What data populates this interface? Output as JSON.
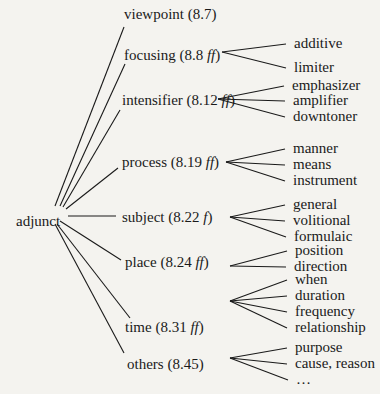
{
  "root": {
    "label": "adjunct"
  },
  "categories": [
    {
      "name": "viewpoint",
      "ref": "8.7",
      "suffix": "",
      "children": []
    },
    {
      "name": "focusing",
      "ref": "8.8",
      "suffix": "ff",
      "children": [
        "additive",
        "limiter"
      ]
    },
    {
      "name": "intensifier",
      "ref": "8.12",
      "suffix": "ff",
      "children": [
        "emphasizer",
        "amplifier",
        "downtoner"
      ]
    },
    {
      "name": "process",
      "ref": "8.19",
      "suffix": "ff",
      "children": [
        "manner",
        "means",
        "instrument"
      ]
    },
    {
      "name": "subject",
      "ref": "8.22",
      "suffix": "f",
      "children": [
        "general",
        "volitional",
        "formulaic"
      ]
    },
    {
      "name": "place",
      "ref": "8.24",
      "suffix": "ff",
      "children": [
        "position",
        "direction"
      ]
    },
    {
      "name": "time",
      "ref": "8.31",
      "suffix": "ff",
      "children": [
        "when",
        "duration",
        "frequency",
        "relationship"
      ]
    },
    {
      "name": "others",
      "ref": "8.45",
      "suffix": "",
      "children": [
        "purpose",
        "cause, reason",
        "…"
      ]
    }
  ]
}
